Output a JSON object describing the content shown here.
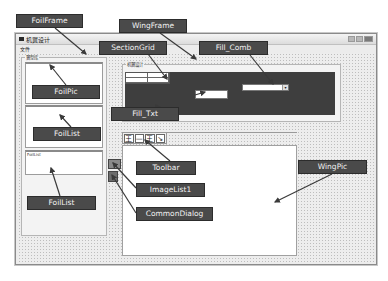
{
  "window": {
    "title": "机翼设计",
    "menu": [
      {
        "label": "文件"
      }
    ],
    "buttons": [
      "minimize",
      "maximize",
      "close"
    ]
  },
  "foil_frame": {
    "label": "翼型库",
    "foil_list_text": "FoilList"
  },
  "wing_frame": {
    "label": "机翼设计"
  },
  "toolbar": {
    "buttons": [
      {
        "icon": "section-icon",
        "glyph": "王"
      },
      {
        "icon": "wing-plan-icon",
        "glyph": "—"
      },
      {
        "icon": "wing-section-icon",
        "glyph": "王"
      },
      {
        "icon": "export-icon",
        "glyph": "↘"
      }
    ]
  },
  "callouts": [
    {
      "id": "foilframe",
      "label": "FoilFrame"
    },
    {
      "id": "wingframe",
      "label": "WingFrame"
    },
    {
      "id": "sectiongrid",
      "label": "SectionGrid"
    },
    {
      "id": "fillcomb",
      "label": "Fill_Comb"
    },
    {
      "id": "foilpic",
      "label": "FoilPic"
    },
    {
      "id": "filltxt",
      "label": "Fill_Txt"
    },
    {
      "id": "foillist1",
      "label": "FoilList"
    },
    {
      "id": "toolbar",
      "label": "Toolbar"
    },
    {
      "id": "wingpic",
      "label": "WingPic"
    },
    {
      "id": "imagelist",
      "label": "ImageList1"
    },
    {
      "id": "foillist2",
      "label": "FoilList"
    },
    {
      "id": "commondialog",
      "label": "CommonDialog"
    }
  ],
  "colors": {
    "callout_bg": "#4a4a4a",
    "callout_text": "#f2f2f2",
    "dark_panel": "#3e3e3e",
    "arrow": "#3a3a3a"
  }
}
